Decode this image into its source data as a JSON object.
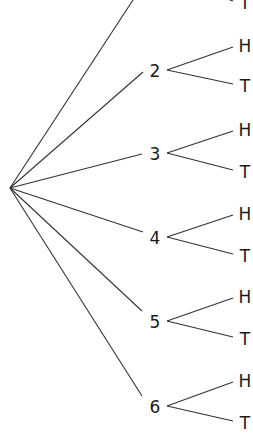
{
  "diagram": {
    "type": "tree",
    "title": "",
    "root": {
      "x": 10,
      "y": 188
    },
    "nodes": [
      {
        "label": "1",
        "x": 155,
        "y": -22,
        "visible": false,
        "branch_end": [
          133,
          0
        ],
        "outcomes": [
          {
            "label": "H",
            "y": -40
          },
          {
            "label": "T",
            "y": 3
          }
        ]
      },
      {
        "label": "2",
        "x": 155,
        "y": 71,
        "branch_end": [
          143,
          72
        ],
        "outcomes": [
          {
            "label": "H",
            "y": 46
          },
          {
            "label": "T",
            "y": 86
          }
        ]
      },
      {
        "label": "3",
        "x": 155,
        "y": 154,
        "branch_end": [
          142,
          154
        ],
        "outcomes": [
          {
            "label": "H",
            "y": 130
          },
          {
            "label": "T",
            "y": 172
          }
        ]
      },
      {
        "label": "4",
        "x": 155,
        "y": 238,
        "branch_end": [
          143,
          232
        ],
        "outcomes": [
          {
            "label": "H",
            "y": 214
          },
          {
            "label": "T",
            "y": 256
          }
        ]
      },
      {
        "label": "5",
        "x": 155,
        "y": 322,
        "branch_end": [
          142,
          311
        ],
        "outcomes": [
          {
            "label": "H",
            "y": 297
          },
          {
            "label": "T",
            "y": 339
          }
        ]
      },
      {
        "label": "6",
        "x": 155,
        "y": 407,
        "branch_end": [
          142,
          396
        ],
        "outcomes": [
          {
            "label": "H",
            "y": 381
          },
          {
            "label": "T",
            "y": 423
          }
        ]
      }
    ],
    "outcome_x": 245,
    "line_color": "#333333"
  }
}
